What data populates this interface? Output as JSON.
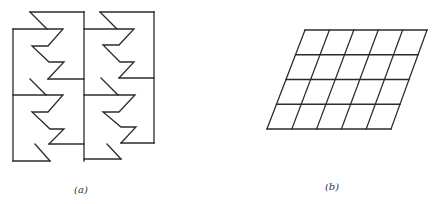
{
  "figure": {
    "panels": [
      {
        "id": "a",
        "label": "(a)",
        "label_pos": [
          81,
          189
        ],
        "description": "Two columns of interlocking zigzag-edged tiles (tessellation)",
        "polylines": [
          [
            [
              30,
              12
            ],
            [
              84,
              12
            ]
          ],
          [
            [
              84,
              12
            ],
            [
              84,
              161
            ]
          ],
          [
            [
              30,
              12
            ],
            [
              47,
              29
            ],
            [
              63,
              29
            ],
            [
              48,
              46
            ],
            [
              32,
              46
            ],
            [
              49,
              62
            ],
            [
              64,
              62
            ],
            [
              48,
              79
            ]
          ],
          [
            [
              13,
              29
            ],
            [
              47,
              29
            ]
          ],
          [
            [
              13,
              29
            ],
            [
              13,
              161
            ]
          ],
          [
            [
              48,
              79
            ],
            [
              84,
              79
            ]
          ],
          [
            [
              30,
              79
            ],
            [
              46,
              95
            ],
            [
              63,
              95
            ],
            [
              48,
              112
            ],
            [
              32,
              112
            ],
            [
              50,
              129
            ],
            [
              64,
              129
            ],
            [
              49,
              144
            ]
          ],
          [
            [
              13,
              95
            ],
            [
              46,
              95
            ]
          ],
          [
            [
              49,
              144
            ],
            [
              84,
              144
            ]
          ],
          [
            [
              35,
              144
            ],
            [
              50,
              161
            ]
          ],
          [
            [
              13,
              161
            ],
            [
              50,
              161
            ]
          ],
          [
            [
              100,
              12
            ],
            [
              154,
              12
            ]
          ],
          [
            [
              154,
              12
            ],
            [
              154,
              143
            ]
          ],
          [
            [
              100,
              12
            ],
            [
              117,
              29
            ],
            [
              134,
              29
            ],
            [
              119,
              45
            ],
            [
              103,
              45
            ],
            [
              120,
              62
            ],
            [
              134,
              62
            ],
            [
              119,
              78
            ]
          ],
          [
            [
              84,
              29
            ],
            [
              117,
              29
            ]
          ],
          [
            [
              119,
              78
            ],
            [
              154,
              78
            ]
          ],
          [
            [
              101,
              78
            ],
            [
              118,
              95
            ],
            [
              135,
              95
            ],
            [
              119,
              112
            ],
            [
              103,
              112
            ],
            [
              121,
              127
            ],
            [
              136,
              127
            ],
            [
              121,
              143
            ]
          ],
          [
            [
              84,
              95
            ],
            [
              118,
              95
            ]
          ],
          [
            [
              121,
              143
            ],
            [
              154,
              143
            ]
          ],
          [
            [
              107,
              144
            ],
            [
              121,
              159
            ]
          ],
          [
            [
              84,
              159
            ],
            [
              121,
              159
            ]
          ]
        ]
      },
      {
        "id": "b",
        "label": "(b)",
        "label_pos": [
          332,
          186
        ],
        "description": "Sheared (parallelogram) grid of 5 columns by 4 rows",
        "grid": {
          "top_left": [
            305,
            30
          ],
          "top_right": [
            427,
            30
          ],
          "bottom_left": [
            267,
            129
          ],
          "bottom_right": [
            391,
            129
          ],
          "columns": 5,
          "rows": 4
        }
      }
    ],
    "stroke_color": "#2b2b2b",
    "background": "#ffffff"
  }
}
